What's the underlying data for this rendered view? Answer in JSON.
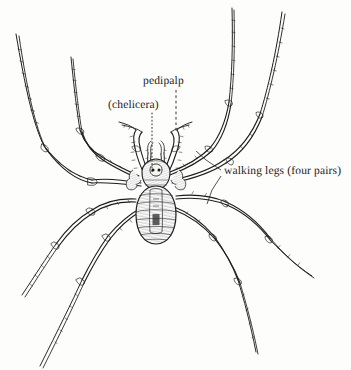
{
  "figure": {
    "kind": "scientific-line-illustration",
    "background_color": "#fdfdfc",
    "ink_color": "#1b1b1b",
    "width": 351,
    "height": 370
  },
  "labels": {
    "pedipalp": "pedipalp",
    "chelicera": "(chelicera)",
    "walking_legs": "walking legs (four pairs)"
  },
  "leaders": {
    "pedipalp_style": "dashed-vertical",
    "chelicera_style": "dotted-vertical",
    "walking_legs_style": "solid-forked"
  },
  "anatomy": {
    "body_parts": [
      "chelicera",
      "pedipalp",
      "cephalothorax",
      "abdomen",
      "walking legs"
    ],
    "leg_pairs": 4
  }
}
